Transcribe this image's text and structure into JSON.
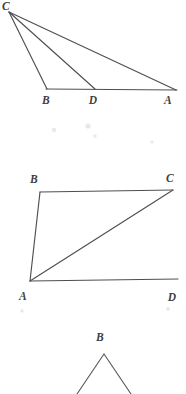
{
  "document": {
    "kind": "geometry-worksheet-figures",
    "background_color": "#ffffff",
    "line_color": "#4f4f52",
    "label_color": "#3f3f42",
    "figure_count": 3
  },
  "figures": [
    {
      "id": "figure-1",
      "name": "triangle-with-cevians",
      "description": "Triangle with apex at top-left and a horizontal base; two cevians drawn from the apex to the base",
      "labels": [
        {
          "text": "C",
          "x": 6,
          "y": 10
        },
        {
          "text": "B",
          "x": 46,
          "y": 104
        },
        {
          "text": "D",
          "x": 93,
          "y": 104
        },
        {
          "text": "A",
          "x": 168,
          "y": 104
        }
      ],
      "vertices": {
        "C": {
          "x": 9,
          "y": 12
        },
        "B": {
          "x": 47,
          "y": 89
        },
        "D": {
          "x": 95,
          "y": 89
        },
        "A": {
          "x": 176,
          "y": 90
        }
      },
      "segments": [
        {
          "name": "C-B",
          "from": "C",
          "to": "B"
        },
        {
          "name": "C-D",
          "from": "C",
          "to": "D"
        },
        {
          "name": "C-A",
          "from": "C",
          "to": "A"
        },
        {
          "name": "B-A-base",
          "from": "B",
          "to": "A"
        }
      ]
    },
    {
      "id": "figure-2",
      "name": "quadrilateral-with-diagonal",
      "description": "Quadrilateral ABCD drawn as a slanted trapezoid with diagonal AC",
      "labels": [
        {
          "text": "B",
          "x": 34,
          "y": 183
        },
        {
          "text": "C",
          "x": 170,
          "y": 182
        },
        {
          "text": "A",
          "x": 23,
          "y": 300
        },
        {
          "text": "D",
          "x": 172,
          "y": 301
        }
      ],
      "vertices": {
        "B": {
          "x": 40,
          "y": 192
        },
        "C": {
          "x": 173,
          "y": 190
        },
        "A": {
          "x": 30,
          "y": 281
        },
        "D": {
          "x": 178,
          "y": 279
        }
      },
      "segments": [
        {
          "name": "B-C-top",
          "from": "B",
          "to": "C"
        },
        {
          "name": "B-A-left",
          "from": "B",
          "to": "A"
        },
        {
          "name": "A-D-bottom",
          "from": "A",
          "to": "D"
        },
        {
          "name": "A-C-diagonal",
          "from": "A",
          "to": "C"
        }
      ]
    },
    {
      "id": "figure-3",
      "name": "partial-triangle-cropped",
      "description": "Apex of a triangle labeled B; the two sides run off the bottom edge of the image",
      "labels": [
        {
          "text": "B",
          "x": 100,
          "y": 341
        }
      ],
      "vertices": {
        "B": {
          "x": 104,
          "y": 354
        },
        "left_edge_end": {
          "x": 77,
          "y": 394
        },
        "right_edge_end": {
          "x": 131,
          "y": 394
        }
      },
      "segments": [
        {
          "name": "B-left-leg",
          "from": "B",
          "to": "left_edge_end"
        },
        {
          "name": "B-right-leg",
          "from": "B",
          "to": "right_edge_end"
        }
      ]
    }
  ]
}
